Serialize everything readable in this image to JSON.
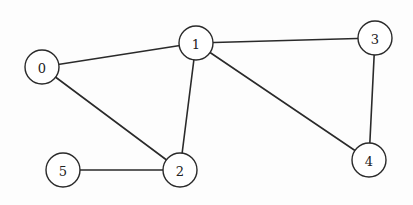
{
  "diagram": {
    "type": "undirected-graph",
    "node_radius": 17,
    "colors": {
      "background": "#fdfdfd",
      "stroke": "#2a2a2a",
      "node_fill": "#ffffff",
      "label": "#222222"
    },
    "nodes": [
      {
        "id": "0",
        "label": "0",
        "x": 42,
        "y": 67
      },
      {
        "id": "1",
        "label": "1",
        "x": 196,
        "y": 43
      },
      {
        "id": "2",
        "label": "2",
        "x": 180,
        "y": 170
      },
      {
        "id": "3",
        "label": "3",
        "x": 375,
        "y": 38
      },
      {
        "id": "4",
        "label": "4",
        "x": 369,
        "y": 160
      },
      {
        "id": "5",
        "label": "5",
        "x": 63,
        "y": 170
      }
    ],
    "edges": [
      {
        "from": "0",
        "to": "1"
      },
      {
        "from": "0",
        "to": "2"
      },
      {
        "from": "1",
        "to": "2"
      },
      {
        "from": "1",
        "to": "3"
      },
      {
        "from": "1",
        "to": "4"
      },
      {
        "from": "3",
        "to": "4"
      },
      {
        "from": "5",
        "to": "2"
      }
    ]
  }
}
